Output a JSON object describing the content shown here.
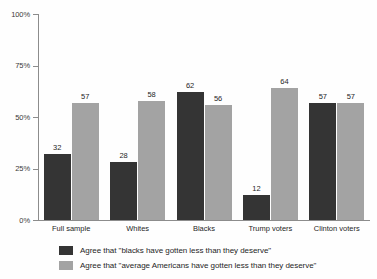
{
  "chart_data": {
    "type": "bar",
    "title": "",
    "subtitle": "",
    "xlabel": "",
    "ylabel": "",
    "ylim": [
      0,
      100
    ],
    "grid": false,
    "legend_position": "bottom",
    "categories": [
      "Full sample",
      "Whites",
      "Blacks",
      "Trump voters",
      "Clinton voters"
    ],
    "ytick_labels": [
      "100%",
      "75%",
      "50%",
      "25%",
      "0%"
    ],
    "ytick_values": [
      100,
      75,
      50,
      25,
      0
    ],
    "series": [
      {
        "name": "Agree that \"blacks have gotten less than they deserve\"",
        "color": "#343434",
        "values": [
          32,
          28,
          62,
          12,
          57
        ]
      },
      {
        "name": "Agree that \"average Americans have gotten less than they deserve\"",
        "color": "#a3a3a3",
        "values": [
          57,
          58,
          56,
          64,
          57
        ]
      }
    ]
  }
}
